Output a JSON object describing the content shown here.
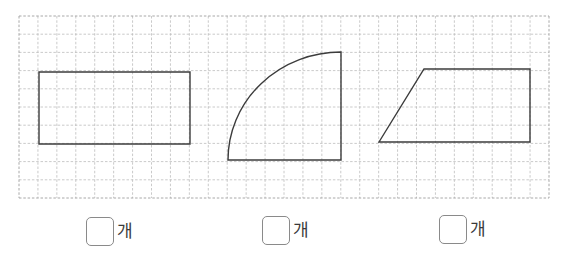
{
  "grid": {
    "x": 19,
    "y": 16,
    "width": 530,
    "height": 182,
    "cols": 28,
    "rows": 10,
    "line_color": "#bdbdbd",
    "border_color": "#a8a8a8"
  },
  "shapes": [
    {
      "name": "rectangle",
      "type": "polygon",
      "points": "39,72 190,72 190,144 39,144"
    },
    {
      "name": "quarter-circle",
      "type": "path",
      "d": "M 341 160 L 228 160 A 113 108 0 0 1 341 52 Z"
    },
    {
      "name": "trapezoid",
      "type": "polygon",
      "points": "379,142 424,69 530,69 530,142"
    }
  ],
  "shape_stroke": "#3c3c3c",
  "answers": [
    {
      "x": 86,
      "y": 217,
      "value": "",
      "unit": "개"
    },
    {
      "x": 262,
      "y": 216,
      "value": "",
      "unit": "개"
    },
    {
      "x": 439,
      "y": 215,
      "value": "",
      "unit": "개"
    }
  ]
}
